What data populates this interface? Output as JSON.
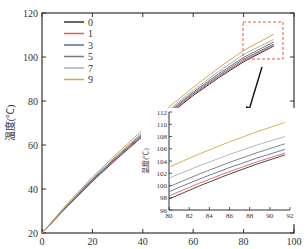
{
  "chart_data": {
    "type": "line",
    "title": "",
    "xlabel": "x",
    "ylabel": "温度(℃)",
    "xlim": [
      0,
      100
    ],
    "ylim": [
      20,
      120
    ],
    "xticks": [
      0,
      20,
      40,
      60,
      80,
      100
    ],
    "yticks": [
      20,
      40,
      60,
      80,
      100,
      120
    ],
    "grid": false,
    "legend_position": "upper-left",
    "x": [
      0,
      10,
      20,
      30,
      40,
      50,
      60,
      70,
      80,
      92
    ],
    "series": [
      {
        "name": "0",
        "color": "#333333",
        "values": [
          20,
          32,
          43.5,
          54,
          64,
          73.5,
          82.5,
          90.5,
          97.8,
          105
        ]
      },
      {
        "name": "1",
        "color": "#e06060",
        "values": [
          20,
          32.2,
          43.8,
          54.3,
          64.4,
          73.9,
          82.9,
          91,
          98.3,
          105.3
        ]
      },
      {
        "name": "3",
        "color": "#5a6e9e",
        "values": [
          20,
          32.4,
          44.1,
          54.7,
          64.8,
          74.4,
          83.4,
          91.6,
          99,
          105.9
        ]
      },
      {
        "name": "5",
        "color": "#777777",
        "values": [
          20,
          32.6,
          44.4,
          55.1,
          65.3,
          75,
          84,
          92.3,
          99.8,
          106.8
        ]
      },
      {
        "name": "7",
        "color": "#aab0b8",
        "values": [
          20,
          32.9,
          44.8,
          55.6,
          65.9,
          75.7,
          84.8,
          93.3,
          101.2,
          108
        ]
      },
      {
        "name": "9",
        "color": "#d4a94a",
        "values": [
          20,
          33.3,
          45.4,
          56.4,
          66.9,
          76.9,
          86.2,
          95,
          103,
          110.3
        ]
      }
    ],
    "inset": {
      "xlim": [
        80,
        92
      ],
      "ylim": [
        96,
        112
      ],
      "xticks": [
        80,
        82,
        84,
        86,
        88,
        90,
        92
      ],
      "yticks": [
        96,
        98,
        100,
        102,
        104,
        106,
        108,
        110,
        112
      ],
      "ylabel": "温度(℃)",
      "lines": [
        {
          "name": "0",
          "start": 97.8,
          "end": 105
        },
        {
          "name": "1",
          "start": 98.3,
          "end": 105.3
        },
        {
          "name": "3",
          "start": 99,
          "end": 105.9
        },
        {
          "name": "5",
          "start": 99.8,
          "end": 106.8
        },
        {
          "name": "7",
          "start": 101.2,
          "end": 108
        },
        {
          "name": "9",
          "start": 103,
          "end": 110.3
        }
      ]
    }
  },
  "labels": {
    "ylabel": "温度(℃)",
    "xlabel": "x",
    "inset_ylabel": "温度(℃)",
    "caption": "图 ... 温度随位置变化曲线"
  }
}
